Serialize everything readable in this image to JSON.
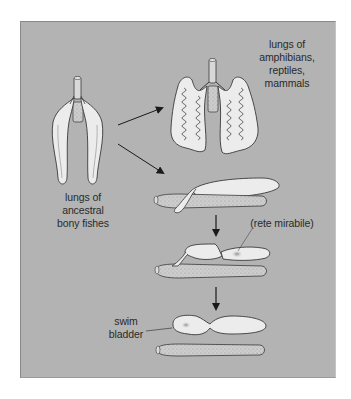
{
  "figure": {
    "background_color": "#b3b3b3",
    "organ_fill": "#ececec",
    "outline_color": "#3a3a3a",
    "gut_fill": "#c8c8c8",
    "labels": {
      "ancestral_lungs": [
        "lungs of",
        "ancestral",
        "bony fishes"
      ],
      "tetrapod_lungs": [
        "lungs of",
        "amphibians,",
        "reptiles,",
        "mammals"
      ],
      "rete": "(rete mirabile)",
      "swim_bladder": [
        "swim",
        "bladder"
      ]
    },
    "arrows": [
      {
        "from": "ancestral_lungs",
        "to": "tetrapod_lungs"
      },
      {
        "from": "ancestral_lungs",
        "to": "fish_stage_1"
      },
      {
        "from": "fish_stage_1",
        "to": "fish_stage_2"
      },
      {
        "from": "fish_stage_2",
        "to": "fish_stage_3"
      }
    ]
  }
}
